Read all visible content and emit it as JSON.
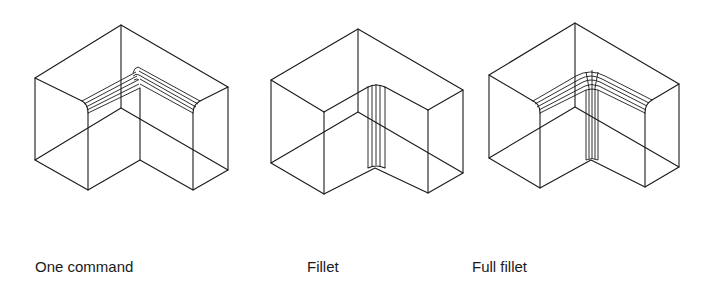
{
  "figures": [
    {
      "id": "one-command",
      "caption": "One command"
    },
    {
      "id": "fillet",
      "caption": "Fillet"
    },
    {
      "id": "full-fillet",
      "caption": "Full fillet"
    }
  ],
  "colors": {
    "line": "#1a1a1a",
    "background": "#ffffff"
  }
}
